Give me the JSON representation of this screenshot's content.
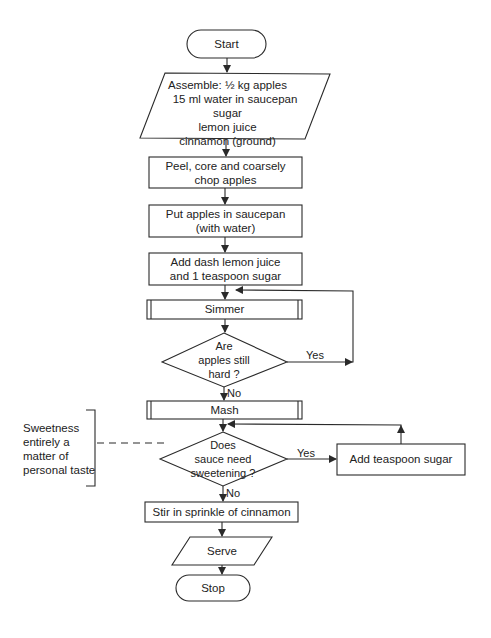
{
  "diagram": {
    "type": "flowchart",
    "nodes": {
      "start": {
        "shape": "terminator",
        "label": "Start"
      },
      "assemble": {
        "shape": "input-output",
        "lines": [
          "Assemble:   ½ kg apples",
          "15 ml water in  saucepan",
          "sugar",
          "lemon juice",
          "cinnamon (ground)"
        ]
      },
      "peel": {
        "shape": "process",
        "lines": [
          "Peel, core and coarsely",
          "chop apples"
        ]
      },
      "put": {
        "shape": "process",
        "lines": [
          "Put apples in saucepan",
          "(with  water)"
        ]
      },
      "add_dash": {
        "shape": "process",
        "lines": [
          "Add dash lemon  juice",
          "and 1 teaspoon sugar"
        ]
      },
      "simmer": {
        "shape": "predefined-process",
        "label": "Simmer"
      },
      "hard": {
        "shape": "decision",
        "lines": [
          "Are",
          "apples still",
          "hard ?"
        ]
      },
      "mash": {
        "shape": "predefined-process",
        "label": "Mash"
      },
      "sweeten": {
        "shape": "decision",
        "lines": [
          "Does",
          "sauce need",
          "sweetening ?"
        ]
      },
      "add_sugar": {
        "shape": "process",
        "label": "Add teaspoon  sugar"
      },
      "stir": {
        "shape": "process",
        "label": "Stir in sprinkle of cinnamon"
      },
      "serve": {
        "shape": "input-output",
        "label": "Serve"
      },
      "stop": {
        "shape": "terminator",
        "label": "Stop"
      }
    },
    "edge_labels": {
      "hard_yes": "Yes",
      "hard_no": "No",
      "sweeten_yes": "Yes",
      "sweeten_no": "No"
    },
    "annotation": {
      "lines": [
        "Sweetness",
        "entirely a",
        "matter of",
        "personal taste"
      ]
    },
    "colors": {
      "line": "#2a2a2a",
      "background": "#ffffff",
      "text": "#222222"
    }
  }
}
